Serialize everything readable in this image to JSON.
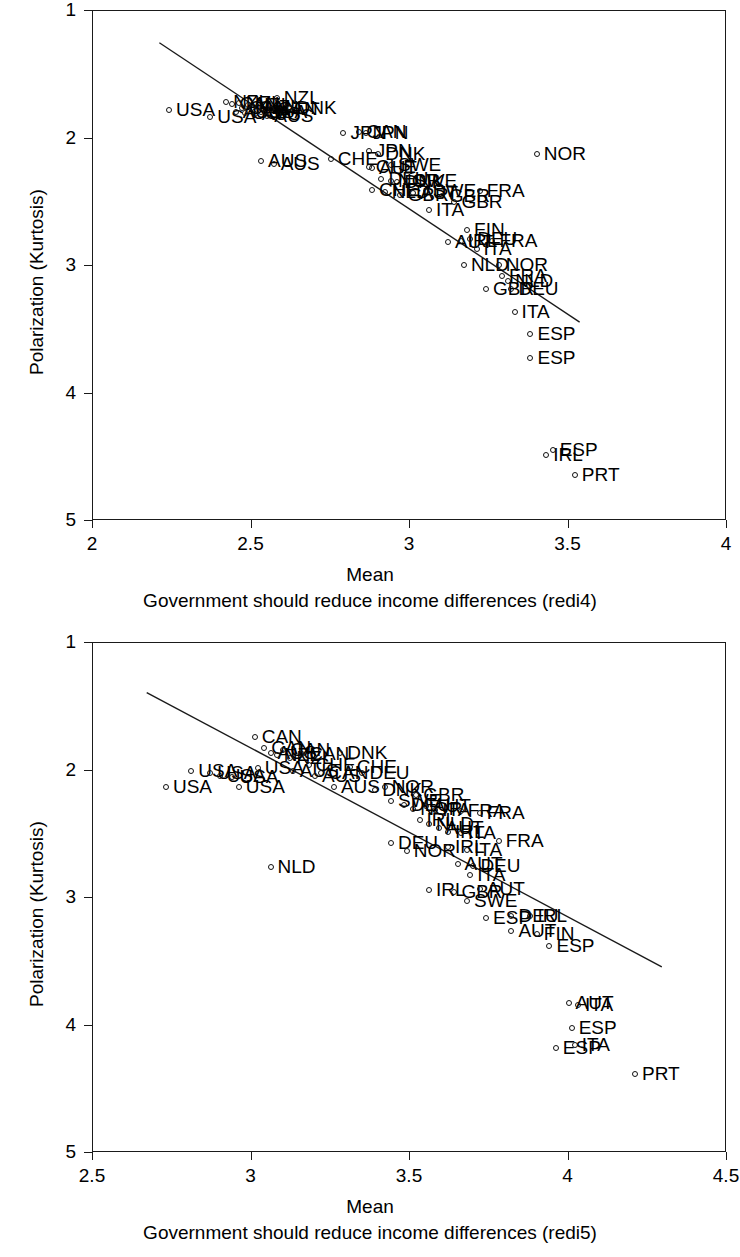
{
  "chart_data": [
    {
      "id": "redi4",
      "type": "scatter",
      "title": "",
      "xlabel": "Mean",
      "ylabel": "Polarization (Kurtosis)",
      "caption": "Government should reduce income differences (redi4)",
      "xlim": [
        2,
        4
      ],
      "ylim": [
        1,
        5
      ],
      "y_inverted": true,
      "xticks": [
        "2",
        "2.5",
        "3",
        "3.5",
        "4"
      ],
      "xtick_values": [
        2,
        2.5,
        3,
        3.5,
        4
      ],
      "yticks": [
        "1",
        "2",
        "3",
        "4",
        "5"
      ],
      "ytick_values": [
        1,
        2,
        3,
        4,
        5
      ],
      "grid": false,
      "legend": "none",
      "fit_line": {
        "x0": 2.21,
        "y0": 1.25,
        "x1": 3.54,
        "y1": 3.45
      },
      "points": [
        {
          "label": "USA",
          "x": 2.24,
          "y": 1.78
        },
        {
          "label": "USA",
          "x": 2.37,
          "y": 1.83
        },
        {
          "label": "NZL",
          "x": 2.42,
          "y": 1.71
        },
        {
          "label": "CAN",
          "x": 2.44,
          "y": 1.73
        },
        {
          "label": "AUS",
          "x": 2.45,
          "y": 1.79
        },
        {
          "label": "NZL",
          "x": 2.46,
          "y": 1.72
        },
        {
          "label": "CAN",
          "x": 2.47,
          "y": 1.76
        },
        {
          "label": "USA",
          "x": 2.48,
          "y": 1.8
        },
        {
          "label": "NZL",
          "x": 2.49,
          "y": 1.74
        },
        {
          "label": "CAN",
          "x": 2.5,
          "y": 1.76
        },
        {
          "label": "AUS",
          "x": 2.51,
          "y": 1.81
        },
        {
          "label": "NZL",
          "x": 2.52,
          "y": 1.75
        },
        {
          "label": "USA",
          "x": 2.53,
          "y": 1.79
        },
        {
          "label": "AUS",
          "x": 2.55,
          "y": 1.82
        },
        {
          "label": "CAN",
          "x": 2.56,
          "y": 1.77
        },
        {
          "label": "NZL",
          "x": 2.58,
          "y": 1.68
        },
        {
          "label": "DNK",
          "x": 2.62,
          "y": 1.76
        },
        {
          "label": "AUS",
          "x": 2.53,
          "y": 2.18
        },
        {
          "label": "AUS",
          "x": 2.57,
          "y": 2.2
        },
        {
          "label": "JPN",
          "x": 2.79,
          "y": 1.96
        },
        {
          "label": "CAN",
          "x": 2.84,
          "y": 1.95
        },
        {
          "label": "JPN",
          "x": 2.86,
          "y": 1.96
        },
        {
          "label": "CHE",
          "x": 2.75,
          "y": 2.16
        },
        {
          "label": "JPN",
          "x": 2.87,
          "y": 2.1
        },
        {
          "label": "DNK",
          "x": 2.9,
          "y": 2.12
        },
        {
          "label": "CHE",
          "x": 2.87,
          "y": 2.22
        },
        {
          "label": "AUT",
          "x": 2.88,
          "y": 2.23
        },
        {
          "label": "SWE",
          "x": 2.94,
          "y": 2.21
        },
        {
          "label": "DEU",
          "x": 2.91,
          "y": 2.32
        },
        {
          "label": "NOR",
          "x": 2.94,
          "y": 2.33
        },
        {
          "label": "DNK",
          "x": 2.96,
          "y": 2.34
        },
        {
          "label": "SWE",
          "x": 2.99,
          "y": 2.33
        },
        {
          "label": "CHE",
          "x": 2.88,
          "y": 2.4
        },
        {
          "label": "NLD",
          "x": 2.92,
          "y": 2.42
        },
        {
          "label": "GBR",
          "x": 2.97,
          "y": 2.44
        },
        {
          "label": "AUT",
          "x": 3.01,
          "y": 2.43
        },
        {
          "label": "SWE",
          "x": 3.05,
          "y": 2.41
        },
        {
          "label": "GBR",
          "x": 3.1,
          "y": 2.45
        },
        {
          "label": "FRA",
          "x": 3.22,
          "y": 2.41
        },
        {
          "label": "GBR",
          "x": 3.14,
          "y": 2.5
        },
        {
          "label": "ITA",
          "x": 3.06,
          "y": 2.56
        },
        {
          "label": "FIN",
          "x": 3.18,
          "y": 2.72
        },
        {
          "label": "AUT",
          "x": 3.12,
          "y": 2.81
        },
        {
          "label": "IRL",
          "x": 3.16,
          "y": 2.8
        },
        {
          "label": "DEU",
          "x": 3.19,
          "y": 2.79
        },
        {
          "label": "FRA",
          "x": 3.26,
          "y": 2.8
        },
        {
          "label": "ITA",
          "x": 3.21,
          "y": 2.87
        },
        {
          "label": "NLD",
          "x": 3.17,
          "y": 2.99
        },
        {
          "label": "NOR",
          "x": 3.28,
          "y": 2.99
        },
        {
          "label": "FRA",
          "x": 3.29,
          "y": 3.08
        },
        {
          "label": "NLD",
          "x": 3.31,
          "y": 3.12
        },
        {
          "label": "GBR",
          "x": 3.24,
          "y": 3.18
        },
        {
          "label": "DEU",
          "x": 3.32,
          "y": 3.18
        },
        {
          "label": "ITA",
          "x": 3.33,
          "y": 3.36
        },
        {
          "label": "ESP",
          "x": 3.38,
          "y": 3.53
        },
        {
          "label": "ESP",
          "x": 3.38,
          "y": 3.72
        },
        {
          "label": "NOR",
          "x": 3.4,
          "y": 2.12
        },
        {
          "label": "IRL",
          "x": 3.43,
          "y": 4.48
        },
        {
          "label": "ESP",
          "x": 3.45,
          "y": 4.44
        },
        {
          "label": "PRT",
          "x": 3.52,
          "y": 4.64
        }
      ]
    },
    {
      "id": "redi5",
      "type": "scatter",
      "title": "",
      "xlabel": "Mean",
      "ylabel": "Polarization (Kurtosis)",
      "caption": "Government should reduce income differences (redi5)",
      "xlim": [
        2.5,
        4.5
      ],
      "ylim": [
        1,
        5
      ],
      "y_inverted": true,
      "xticks": [
        "2.5",
        "3",
        "3.5",
        "4",
        "4.5"
      ],
      "xtick_values": [
        2.5,
        3,
        3.5,
        4,
        4.5
      ],
      "yticks": [
        "1",
        "2",
        "3",
        "4",
        "5"
      ],
      "ytick_values": [
        1,
        2,
        3,
        4,
        5
      ],
      "grid": false,
      "legend": "none",
      "fit_line": {
        "x0": 2.67,
        "y0": 1.39,
        "x1": 4.3,
        "y1": 3.55
      },
      "points": [
        {
          "label": "USA",
          "x": 2.73,
          "y": 2.13
        },
        {
          "label": "USA",
          "x": 2.81,
          "y": 2.0
        },
        {
          "label": "USA",
          "x": 2.87,
          "y": 2.02
        },
        {
          "label": "USA",
          "x": 2.9,
          "y": 2.04
        },
        {
          "label": "USA",
          "x": 2.94,
          "y": 2.05
        },
        {
          "label": "USA",
          "x": 2.96,
          "y": 2.13
        },
        {
          "label": "CAN",
          "x": 3.01,
          "y": 1.74
        },
        {
          "label": "USA",
          "x": 3.02,
          "y": 1.98
        },
        {
          "label": "CAN",
          "x": 3.04,
          "y": 1.82
        },
        {
          "label": "AUS",
          "x": 3.06,
          "y": 1.86
        },
        {
          "label": "NZL",
          "x": 3.08,
          "y": 1.88
        },
        {
          "label": "CAN",
          "x": 3.1,
          "y": 1.84
        },
        {
          "label": "NZL",
          "x": 3.12,
          "y": 1.9
        },
        {
          "label": "AUS",
          "x": 3.13,
          "y": 2.0
        },
        {
          "label": "CAN",
          "x": 3.16,
          "y": 1.87
        },
        {
          "label": "CHE",
          "x": 3.18,
          "y": 1.96
        },
        {
          "label": "AUS",
          "x": 3.2,
          "y": 2.04
        },
        {
          "label": "CAN",
          "x": 3.22,
          "y": 2.02
        },
        {
          "label": "DNK",
          "x": 3.28,
          "y": 1.86
        },
        {
          "label": "CHE",
          "x": 3.31,
          "y": 1.97
        },
        {
          "label": "DEU",
          "x": 3.35,
          "y": 2.02
        },
        {
          "label": "AUS",
          "x": 3.26,
          "y": 2.13
        },
        {
          "label": "NLD",
          "x": 3.06,
          "y": 2.76
        },
        {
          "label": "DNK",
          "x": 3.39,
          "y": 2.15
        },
        {
          "label": "NOR",
          "x": 3.42,
          "y": 2.13
        },
        {
          "label": "GBR",
          "x": 3.52,
          "y": 2.19
        },
        {
          "label": "SWE",
          "x": 3.44,
          "y": 2.24
        },
        {
          "label": "DEU",
          "x": 3.48,
          "y": 2.27
        },
        {
          "label": "NOR",
          "x": 3.51,
          "y": 2.3
        },
        {
          "label": "AUT",
          "x": 3.55,
          "y": 2.28
        },
        {
          "label": "ITA",
          "x": 3.58,
          "y": 2.31
        },
        {
          "label": "FRA",
          "x": 3.66,
          "y": 2.32
        },
        {
          "label": "FRA",
          "x": 3.72,
          "y": 2.33
        },
        {
          "label": "IRL",
          "x": 3.53,
          "y": 2.39
        },
        {
          "label": "NLD",
          "x": 3.56,
          "y": 2.42
        },
        {
          "label": "AUT",
          "x": 3.59,
          "y": 2.45
        },
        {
          "label": "IRL",
          "x": 3.62,
          "y": 2.48
        },
        {
          "label": "ITA",
          "x": 3.66,
          "y": 2.49
        },
        {
          "label": "FRA",
          "x": 3.78,
          "y": 2.55
        },
        {
          "label": "DEU",
          "x": 3.44,
          "y": 2.57
        },
        {
          "label": "NOR",
          "x": 3.49,
          "y": 2.63
        },
        {
          "label": "IRL",
          "x": 3.62,
          "y": 2.6
        },
        {
          "label": "ITA",
          "x": 3.68,
          "y": 2.62
        },
        {
          "label": "AUT",
          "x": 3.65,
          "y": 2.73
        },
        {
          "label": "DEU",
          "x": 3.7,
          "y": 2.75
        },
        {
          "label": "ITA",
          "x": 3.69,
          "y": 2.82
        },
        {
          "label": "IRL",
          "x": 3.56,
          "y": 2.94
        },
        {
          "label": "GBR",
          "x": 3.64,
          "y": 2.95
        },
        {
          "label": "AUT",
          "x": 3.72,
          "y": 2.93
        },
        {
          "label": "SWE",
          "x": 3.68,
          "y": 3.02
        },
        {
          "label": "ESP",
          "x": 3.74,
          "y": 3.16
        },
        {
          "label": "DEU",
          "x": 3.82,
          "y": 3.14
        },
        {
          "label": "IRL",
          "x": 3.88,
          "y": 3.14
        },
        {
          "label": "AUT",
          "x": 3.82,
          "y": 3.26
        },
        {
          "label": "FIN",
          "x": 3.9,
          "y": 3.28
        },
        {
          "label": "ESP",
          "x": 3.94,
          "y": 3.38
        },
        {
          "label": "AUT",
          "x": 4.0,
          "y": 3.82
        },
        {
          "label": "ITA",
          "x": 4.03,
          "y": 3.84
        },
        {
          "label": "ESP",
          "x": 4.01,
          "y": 4.02
        },
        {
          "label": "ESP",
          "x": 3.96,
          "y": 4.18
        },
        {
          "label": "ITA",
          "x": 4.02,
          "y": 4.15
        },
        {
          "label": "PRT",
          "x": 4.21,
          "y": 4.38
        }
      ]
    }
  ]
}
